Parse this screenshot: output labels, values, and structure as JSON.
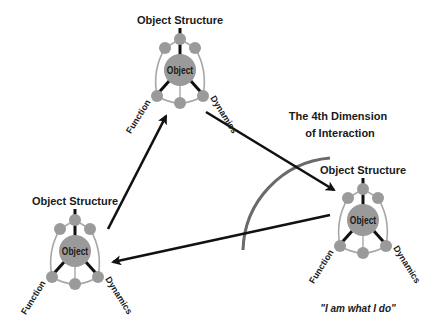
{
  "diagram": {
    "title_line1": "The 4th Dimension",
    "title_line2": "of Interaction",
    "quote": "\"I am what I do\"",
    "colors": {
      "node_fill": "#9a9a9a",
      "frame_stroke": "#a8a8a8",
      "spoke": "#111111",
      "arrow": "#111111",
      "arc": "#6a6a6a",
      "text": "#1a1a1a"
    },
    "objects": [
      {
        "id": "top",
        "center_label": "Object",
        "structure_label": "Object Structure",
        "function_label": "Function",
        "dynamics_label": "Dynamics",
        "cx": 180,
        "cy": 70
      },
      {
        "id": "left",
        "center_label": "Object",
        "structure_label": "Object Structure",
        "function_label": "Function",
        "dynamics_label": "Dynamics",
        "cx": 75,
        "cy": 251
      },
      {
        "id": "right",
        "center_label": "Object",
        "structure_label": "Object Structure",
        "function_label": "Function",
        "dynamics_label": "Dynamics",
        "cx": 363,
        "cy": 220
      }
    ],
    "arrows": [
      {
        "from": "left",
        "to": "top"
      },
      {
        "from": "top",
        "to": "right"
      },
      {
        "from": "right",
        "to": "left"
      }
    ]
  }
}
